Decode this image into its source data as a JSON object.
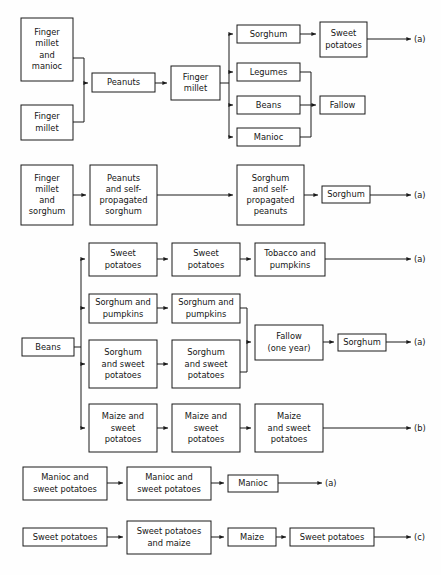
{
  "figure": {
    "type": "flow-diagram",
    "background_color": "#fefefe",
    "line_color": "#1a1a1a",
    "box_fill": "#ffffff"
  },
  "chart_data": {
    "type": "diagram",
    "title": "",
    "sections": [
      {
        "id": "section-1",
        "nodes": [
          {
            "id": "s1n1",
            "label": "Finger millet and manioc",
            "lines": [
              "Finger",
              "millet",
              "and",
              "manioc"
            ],
            "x": 21,
            "y": 18,
            "w": 52,
            "h": 63
          },
          {
            "id": "s1n2",
            "label": "Finger millet",
            "lines": [
              "Finger",
              "millet"
            ],
            "x": 21,
            "y": 105,
            "w": 52,
            "h": 35
          },
          {
            "id": "s1n3",
            "label": "Peanuts",
            "lines": [
              "Peanuts"
            ],
            "x": 92,
            "y": 73,
            "w": 63,
            "h": 19
          },
          {
            "id": "s1n4",
            "label": "Finger millet",
            "lines": [
              "Finger",
              "millet"
            ],
            "x": 171,
            "y": 66,
            "w": 49,
            "h": 34
          },
          {
            "id": "s1n5",
            "label": "Sorghum",
            "lines": [
              "Sorghum"
            ],
            "x": 237,
            "y": 25,
            "w": 63,
            "h": 18
          },
          {
            "id": "s1n6",
            "label": "Legumes",
            "lines": [
              "Legumes"
            ],
            "x": 237,
            "y": 63,
            "w": 63,
            "h": 18
          },
          {
            "id": "s1n7",
            "label": "Beans",
            "lines": [
              "Beans"
            ],
            "x": 237,
            "y": 96,
            "w": 63,
            "h": 18
          },
          {
            "id": "s1n8",
            "label": "Manioc",
            "lines": [
              "Manioc"
            ],
            "x": 237,
            "y": 128,
            "w": 63,
            "h": 18
          },
          {
            "id": "s1n9",
            "label": "Sweet potatoes",
            "lines": [
              "Sweet",
              "potatoes"
            ],
            "x": 320,
            "y": 22,
            "w": 47,
            "h": 35
          },
          {
            "id": "s1n10",
            "label": "Fallow",
            "lines": [
              "Fallow"
            ],
            "x": 320,
            "y": 96,
            "w": 45,
            "h": 18
          }
        ],
        "terminal": "(a)"
      },
      {
        "id": "section-2",
        "nodes": [
          {
            "id": "s2n1",
            "label": "Finger millet and sorghum",
            "lines": [
              "Finger",
              "millet",
              "and",
              "sorghum"
            ],
            "x": 21,
            "y": 165,
            "w": 52,
            "h": 60
          },
          {
            "id": "s2n2",
            "label": "Peanuts and self-propagated sorghum",
            "lines": [
              "Peanuts",
              "and self-",
              "propagated",
              "sorghum"
            ],
            "x": 90,
            "y": 165,
            "w": 67,
            "h": 60
          },
          {
            "id": "s2n3",
            "label": "Sorghum and self-propagated peanuts",
            "lines": [
              "Sorghum",
              "and  self-",
              "propagated",
              "peanuts"
            ],
            "x": 237,
            "y": 165,
            "w": 67,
            "h": 60
          },
          {
            "id": "s2n4",
            "label": "Sorghum",
            "lines": [
              "Sorghum"
            ],
            "x": 322,
            "y": 186,
            "w": 48,
            "h": 17
          }
        ],
        "terminal": "(a)"
      },
      {
        "id": "section-3",
        "nodes": [
          {
            "id": "s3n1",
            "label": "Beans",
            "lines": [
              "Beans"
            ],
            "x": 22,
            "y": 338,
            "w": 52,
            "h": 18
          },
          {
            "id": "s3n2",
            "label": "Sweet potatoes",
            "lines": [
              "Sweet",
              "potatoes"
            ],
            "x": 89,
            "y": 243,
            "w": 68,
            "h": 33
          },
          {
            "id": "s3n3",
            "label": "Sweet potatoes",
            "lines": [
              "Sweet",
              "potatoes"
            ],
            "x": 172,
            "y": 243,
            "w": 68,
            "h": 33
          },
          {
            "id": "s3n4",
            "label": "Tobacco and pumpkins",
            "lines": [
              "Tobacco and",
              "pumpkins"
            ],
            "x": 255,
            "y": 243,
            "w": 70,
            "h": 33
          },
          {
            "id": "s3n5",
            "label": "Sorghum and pumpkins",
            "lines": [
              "Sorghum and",
              "pumpkins"
            ],
            "x": 89,
            "y": 294,
            "w": 68,
            "h": 29
          },
          {
            "id": "s3n6",
            "label": "Sorghum and pumpkins",
            "lines": [
              "Sorghum and",
              "pumpkins"
            ],
            "x": 172,
            "y": 294,
            "w": 68,
            "h": 29
          },
          {
            "id": "s3n7",
            "label": "Sorghum and sweet potatoes",
            "lines": [
              "Sorghum",
              "and sweet",
              "potatoes"
            ],
            "x": 89,
            "y": 340,
            "w": 68,
            "h": 48
          },
          {
            "id": "s3n8",
            "label": "Sorghum and sweet potatoes",
            "lines": [
              "Sorghum",
              "and sweet",
              "potatoes"
            ],
            "x": 172,
            "y": 340,
            "w": 68,
            "h": 48
          },
          {
            "id": "s3n9",
            "label": "Fallow (one year)",
            "lines": [
              "Fallow",
              "(one year)"
            ],
            "x": 255,
            "y": 325,
            "w": 68,
            "h": 35
          },
          {
            "id": "s3n10",
            "label": "Sorghum",
            "lines": [
              "Sorghum"
            ],
            "x": 338,
            "y": 334,
            "w": 48,
            "h": 17
          },
          {
            "id": "s3n11",
            "label": "Maize and sweet potatoes",
            "lines": [
              "Maize and",
              "sweet",
              "potatoes"
            ],
            "x": 89,
            "y": 404,
            "w": 68,
            "h": 48
          },
          {
            "id": "s3n12",
            "label": "Maize and sweet potatoes",
            "lines": [
              "Maize and",
              "sweet",
              "potatoes"
            ],
            "x": 172,
            "y": 404,
            "w": 68,
            "h": 48
          },
          {
            "id": "s3n13",
            "label": "Maize and sweet potatoes",
            "lines": [
              "Maize",
              "and  sweet",
              "potatoes"
            ],
            "x": 255,
            "y": 404,
            "w": 68,
            "h": 48
          }
        ],
        "terminals": [
          "(a)",
          "(a)",
          "(b)"
        ]
      },
      {
        "id": "section-4",
        "nodes": [
          {
            "id": "s4n1",
            "label": "Manioc and sweet potatoes",
            "lines": [
              "Manioc and",
              "sweet potatoes"
            ],
            "x": 23,
            "y": 467,
            "w": 84,
            "h": 33
          },
          {
            "id": "s4n2",
            "label": "Manioc and sweet potatoes",
            "lines": [
              "Manioc and",
              "sweet  potatoes"
            ],
            "x": 127,
            "y": 467,
            "w": 84,
            "h": 33
          },
          {
            "id": "s4n3",
            "label": "Manioc",
            "lines": [
              "Manioc"
            ],
            "x": 228,
            "y": 475,
            "w": 50,
            "h": 17
          }
        ],
        "terminal": "(a)"
      },
      {
        "id": "section-5",
        "nodes": [
          {
            "id": "s5n1",
            "label": "Sweet potatoes",
            "lines": [
              "Sweet  potatoes"
            ],
            "x": 23,
            "y": 528,
            "w": 84,
            "h": 18
          },
          {
            "id": "s5n2",
            "label": "Sweet potatoes and maize",
            "lines": [
              "Sweet potatoes",
              "and  maize"
            ],
            "x": 127,
            "y": 521,
            "w": 84,
            "h": 33
          },
          {
            "id": "s5n3",
            "label": "Maize",
            "lines": [
              "Maize"
            ],
            "x": 228,
            "y": 528,
            "w": 48,
            "h": 18
          },
          {
            "id": "s5n4",
            "label": "Sweet potatoes",
            "lines": [
              "Sweet  potatoes"
            ],
            "x": 290,
            "y": 528,
            "w": 84,
            "h": 18
          }
        ],
        "terminal": "(c)"
      }
    ],
    "terminal_labels": [
      "(a)",
      "(a)",
      "(a)",
      "(a)",
      "(b)",
      "(a)",
      "(c)"
    ]
  }
}
